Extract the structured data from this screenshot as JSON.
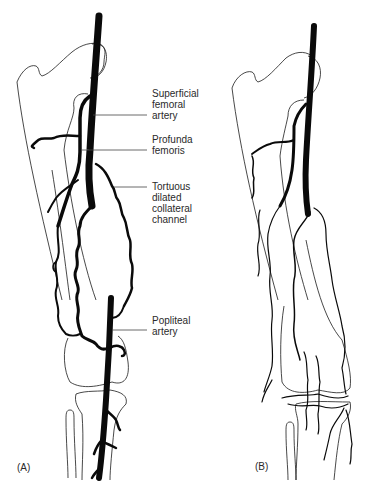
{
  "figure": {
    "panels": [
      {
        "id": "A",
        "label": "(A)"
      },
      {
        "id": "B",
        "label": "(B)"
      }
    ],
    "annotations": [
      {
        "id": "superficial_femoral",
        "lines": [
          "Superficial",
          "femoral",
          "artery"
        ]
      },
      {
        "id": "profunda_femoris",
        "lines": [
          "Profunda",
          "femoris"
        ]
      },
      {
        "id": "tortuous_collateral",
        "lines": [
          "Tortuous",
          "dilated",
          "collateral",
          "channel"
        ]
      },
      {
        "id": "popliteal",
        "lines": [
          "Popliteal",
          "artery"
        ]
      }
    ],
    "colors": {
      "background": "#ffffff",
      "ink": "#0a0a0a",
      "label_text": "#2a2a2a"
    }
  }
}
